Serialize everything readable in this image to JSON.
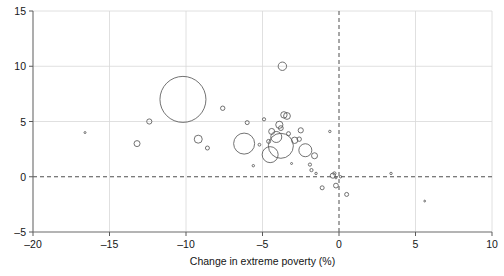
{
  "chart_data": {
    "type": "scatter",
    "title": "",
    "xlabel": "Change in extreme poverty (%)",
    "ylabel": "",
    "xlim": [
      -20,
      10
    ],
    "ylim": [
      -5,
      15
    ],
    "xticks": [
      -20,
      -15,
      -10,
      -5,
      0,
      5,
      10
    ],
    "xticklabels": [
      "–20",
      "–15",
      "–10",
      "–5",
      "0",
      "5",
      "10"
    ],
    "yticks": [
      -5,
      0,
      5,
      10,
      15
    ],
    "yticklabels": [
      "–5",
      "0",
      "5",
      "10",
      "15"
    ],
    "grid": "light gridlines at x = -15,-10,-5,5 and y = 0,5,10",
    "reference_lines": [
      {
        "axis": "x",
        "value": 0,
        "style": "dashed"
      },
      {
        "axis": "y",
        "value": 0,
        "style": "dashed"
      }
    ],
    "legend": "none",
    "marker": "open circle, size encodes a third variable",
    "points": [
      {
        "x": -16.6,
        "y": 4.0,
        "r": 1.0
      },
      {
        "x": -13.2,
        "y": 3.0,
        "r": 3.0
      },
      {
        "x": -12.4,
        "y": 5.0,
        "r": 2.6
      },
      {
        "x": -10.2,
        "y": 7.0,
        "r": 23.0
      },
      {
        "x": -9.2,
        "y": 3.4,
        "r": 4.0
      },
      {
        "x": -8.6,
        "y": 2.6,
        "r": 2.0
      },
      {
        "x": -7.6,
        "y": 6.2,
        "r": 2.2
      },
      {
        "x": -6.2,
        "y": 3.0,
        "r": 10.5
      },
      {
        "x": -6.0,
        "y": 4.9,
        "r": 2.0
      },
      {
        "x": -5.6,
        "y": 1.0,
        "r": 1.2
      },
      {
        "x": -5.2,
        "y": 2.9,
        "r": 1.4
      },
      {
        "x": -4.9,
        "y": 5.2,
        "r": 1.6
      },
      {
        "x": -4.6,
        "y": 3.2,
        "r": 2.0
      },
      {
        "x": -4.5,
        "y": 2.0,
        "r": 8.0
      },
      {
        "x": -4.4,
        "y": 4.1,
        "r": 3.0
      },
      {
        "x": -4.1,
        "y": 3.6,
        "r": 5.5
      },
      {
        "x": -3.9,
        "y": 4.7,
        "r": 3.6
      },
      {
        "x": -3.8,
        "y": 4.4,
        "r": 2.4
      },
      {
        "x": -3.8,
        "y": 2.8,
        "r": 12.5
      },
      {
        "x": -3.7,
        "y": 10.0,
        "r": 4.2
      },
      {
        "x": -3.6,
        "y": 5.6,
        "r": 3.2
      },
      {
        "x": -3.4,
        "y": 5.5,
        "r": 3.4
      },
      {
        "x": -3.3,
        "y": 3.9,
        "r": 2.0
      },
      {
        "x": -3.1,
        "y": 1.2,
        "r": 1.0
      },
      {
        "x": -2.9,
        "y": 3.3,
        "r": 3.2
      },
      {
        "x": -2.6,
        "y": 3.4,
        "r": 2.2
      },
      {
        "x": -2.5,
        "y": 4.2,
        "r": 2.6
      },
      {
        "x": -2.2,
        "y": 2.4,
        "r": 6.5
      },
      {
        "x": -1.9,
        "y": 1.1,
        "r": 1.6
      },
      {
        "x": -1.8,
        "y": 0.6,
        "r": 1.6
      },
      {
        "x": -1.6,
        "y": 1.9,
        "r": 3.0
      },
      {
        "x": -1.5,
        "y": 0.3,
        "r": 1.2
      },
      {
        "x": -1.1,
        "y": -1.0,
        "r": 2.0
      },
      {
        "x": -0.6,
        "y": 4.1,
        "r": 1.2
      },
      {
        "x": -0.4,
        "y": 0.1,
        "r": 2.6
      },
      {
        "x": -0.3,
        "y": 0.3,
        "r": 1.6
      },
      {
        "x": -0.2,
        "y": -0.1,
        "r": 1.0
      },
      {
        "x": -0.2,
        "y": -0.8,
        "r": 2.4
      },
      {
        "x": 0.1,
        "y": 0.0,
        "r": 1.2
      },
      {
        "x": 0.5,
        "y": -1.6,
        "r": 2.0
      },
      {
        "x": 3.4,
        "y": 0.3,
        "r": 1.2
      },
      {
        "x": 5.6,
        "y": -2.2,
        "r": 0.9
      }
    ]
  },
  "page": {
    "clipped_header_text": ""
  }
}
